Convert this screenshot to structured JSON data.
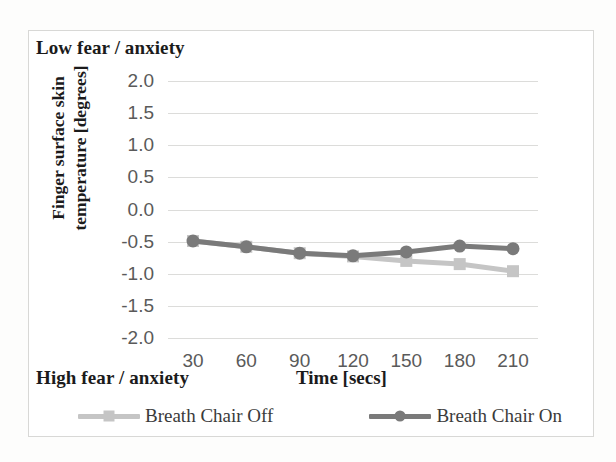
{
  "figure": {
    "top_annotation": "Low fear / anxiety",
    "bottom_annotation": "High fear / anxiety"
  },
  "chart_data": {
    "type": "line",
    "title": "",
    "xlabel": "Time [secs]",
    "ylabel_line1": "Finger surface skin",
    "ylabel_line2": "temperature [degrees]",
    "x": [
      30,
      60,
      90,
      120,
      150,
      180,
      210
    ],
    "xtick_labels": [
      "30",
      "60",
      "90",
      "120",
      "150",
      "180",
      "210"
    ],
    "ytick_labels": [
      "2.0",
      "1.5",
      "1.0",
      "0.5",
      "0.0",
      "-0.5",
      "-1.0",
      "-1.5",
      "-2.0"
    ],
    "ytick_values": [
      2.0,
      1.5,
      1.0,
      0.5,
      0.0,
      -0.5,
      -1.0,
      -1.5,
      -2.0
    ],
    "ylim": [
      -2.0,
      2.0
    ],
    "xlim": [
      30,
      210
    ],
    "grid": true,
    "legend_position": "bottom",
    "series": [
      {
        "name": "Breath Chair Off",
        "color": "#c5c5c5",
        "marker": "square",
        "values": [
          -0.49,
          -0.58,
          -0.68,
          -0.73,
          -0.8,
          -0.85,
          -0.96
        ]
      },
      {
        "name": "Breath Chair On",
        "color": "#7a7a7a",
        "marker": "circle",
        "values": [
          -0.49,
          -0.58,
          -0.68,
          -0.72,
          -0.66,
          -0.57,
          -0.61
        ]
      }
    ]
  },
  "colors": {
    "gridline": "#dcdcda",
    "tick_text": "#5a5a5a",
    "title_text": "#1b1b1b",
    "frame": "#d8d8d6"
  }
}
